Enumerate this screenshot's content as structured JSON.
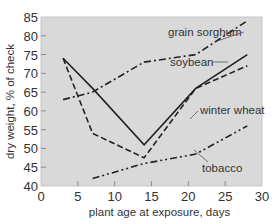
{
  "chart_data": {
    "type": "line",
    "title": "",
    "xlabel": "plant age at exposure, days",
    "ylabel": "dry weight, % of check",
    "xlim": [
      0,
      30
    ],
    "ylim": [
      40,
      85
    ],
    "xticks": [
      0,
      5,
      10,
      15,
      20,
      25,
      30
    ],
    "yticks": [
      40,
      45,
      50,
      55,
      60,
      65,
      70,
      75,
      80,
      85
    ],
    "grid": false,
    "legend": "inline labels",
    "background": "#d9d9d9",
    "series": [
      {
        "name": "grain sorghum",
        "style": "dash-dot",
        "x": [
          3,
          7,
          14,
          21,
          28
        ],
        "y": [
          63,
          65,
          73,
          75,
          84
        ]
      },
      {
        "name": "soybean",
        "style": "dashed",
        "x": [
          3,
          7,
          14,
          21,
          28
        ],
        "y": [
          74,
          54,
          47.5,
          66,
          72
        ]
      },
      {
        "name": "winter wheat",
        "style": "solid",
        "x": [
          3,
          7,
          14,
          21,
          28
        ],
        "y": [
          74,
          66,
          51,
          66,
          75
        ]
      },
      {
        "name": "tobacco",
        "style": "dash-dot-dot",
        "x": [
          7,
          14,
          21,
          28
        ],
        "y": [
          42,
          46,
          48.5,
          56
        ]
      }
    ],
    "annotations": [
      {
        "text": "grain sorghum",
        "x": 168,
        "y": 36,
        "leader_to": [
          217,
          41
        ]
      },
      {
        "text": "soybean",
        "x": 170,
        "y": 66,
        "leader_to": [
          228,
          62
        ]
      },
      {
        "text": "winter wheat",
        "x": 200,
        "y": 114,
        "leader_to": [
          190,
          119
        ]
      },
      {
        "text": "tobacco",
        "x": 202,
        "y": 172,
        "leader_to": [
          194,
          150
        ]
      }
    ]
  }
}
